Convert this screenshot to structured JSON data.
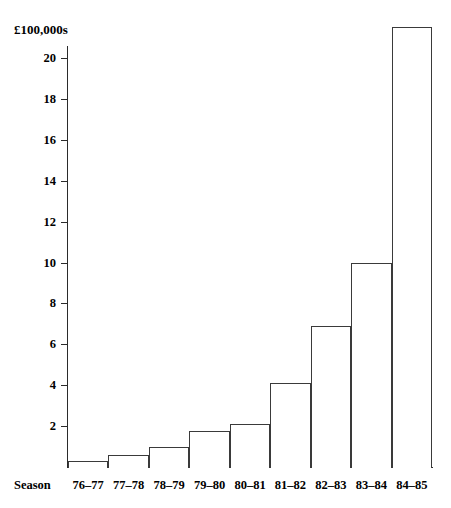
{
  "chart_data": {
    "type": "bar",
    "title": "",
    "subtitle": "",
    "xlabel": "Season",
    "ylabel": "£100,000s",
    "categories": [
      "76–77",
      "77–78",
      "78–79",
      "79–80",
      "80–81",
      "81–82",
      "82–83",
      "83–84",
      "84–85"
    ],
    "values": [
      0.3,
      0.6,
      1.0,
      1.75,
      2.1,
      4.1,
      6.9,
      10.0,
      21.5
    ],
    "ylim": [
      0,
      21.5
    ],
    "ytick_labels": [
      "2",
      "4",
      "6",
      "8",
      "10",
      "12",
      "14",
      "16",
      "18",
      "20"
    ],
    "yticks": [
      2,
      4,
      6,
      8,
      10,
      12,
      14,
      16,
      18,
      20
    ],
    "grid": false,
    "legend": null,
    "legend_position": "none",
    "bar_fill": "#ffffff",
    "bar_stroke": "#3a3a3a",
    "axis_color": "#2b2b2b",
    "background": "#ffffff"
  }
}
